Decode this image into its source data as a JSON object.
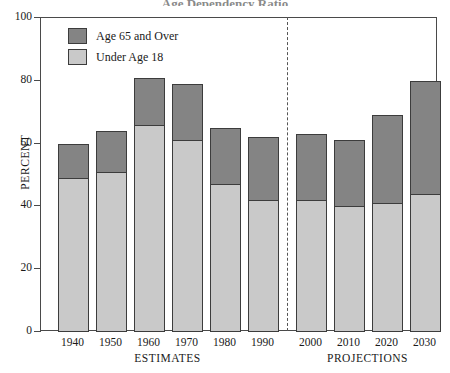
{
  "chart_data": {
    "type": "bar",
    "subtype": "stacked-bar",
    "title": "Age Dependency Ratio",
    "xlabel": "",
    "ylabel": "PERCENT",
    "ylim": [
      0,
      100
    ],
    "yticks": [
      0,
      20,
      40,
      60,
      80,
      100
    ],
    "grid": false,
    "legend_position": "top-left",
    "categories": [
      "1940",
      "1950",
      "1960",
      "1970",
      "1980",
      "1990",
      "2000",
      "2010",
      "2020",
      "2030"
    ],
    "series": [
      {
        "name": "Under Age 18",
        "color": "#c9c9c9",
        "values": [
          49,
          51,
          66,
          61,
          47,
          42,
          42,
          40,
          41,
          44
        ]
      },
      {
        "name": "Age 65 and Over",
        "color": "#848484",
        "values": [
          11,
          13,
          15,
          18,
          18,
          20,
          21,
          21,
          28,
          36
        ]
      }
    ],
    "totals": [
      60,
      64,
      81,
      79,
      65,
      62,
      63,
      61,
      69,
      80
    ],
    "groups": [
      {
        "label": "ESTIMATES",
        "categories": [
          "1940",
          "1950",
          "1960",
          "1970",
          "1980",
          "1990"
        ]
      },
      {
        "label": "PROJECTIONS",
        "categories": [
          "2000",
          "2010",
          "2020",
          "2030"
        ]
      }
    ],
    "annotations": [
      "dashed vertical divider between ESTIMATES and PROJECTIONS"
    ]
  },
  "legend": {
    "items": [
      {
        "label": "Age 65 and Over",
        "color": "#848484"
      },
      {
        "label": "Under Age 18",
        "color": "#c9c9c9"
      }
    ]
  },
  "axes": {
    "y_title": "PERCENT",
    "y_ticks": [
      "100",
      "80",
      "60",
      "40",
      "20",
      "0"
    ],
    "x_ticks": [
      "1940",
      "1950",
      "1960",
      "1970",
      "1980",
      "1990",
      "2000",
      "2010",
      "2020",
      "2030"
    ],
    "group_labels": [
      "ESTIMATES",
      "PROJECTIONS"
    ]
  },
  "title": "Age Dependency Ratio"
}
